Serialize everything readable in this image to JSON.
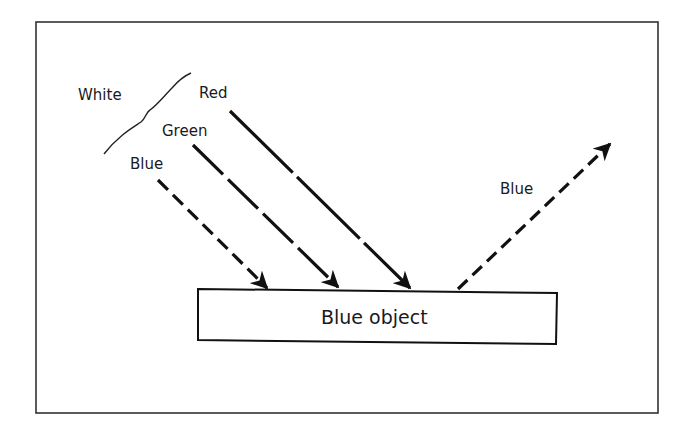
{
  "diagram": {
    "title": "",
    "incoming_light_label": "White",
    "incoming_rays": [
      {
        "label": "Red",
        "dash": "long",
        "absorbed": true
      },
      {
        "label": "Green",
        "dash": "medium",
        "absorbed": true
      },
      {
        "label": "Blue",
        "dash": "short",
        "absorbed": false
      }
    ],
    "reflected_ray": {
      "label": "Blue",
      "dash": "short"
    },
    "object": {
      "label": "Blue object"
    },
    "colors": {
      "stroke": "#111111",
      "background": "#ffffff",
      "border": "#333333"
    }
  }
}
